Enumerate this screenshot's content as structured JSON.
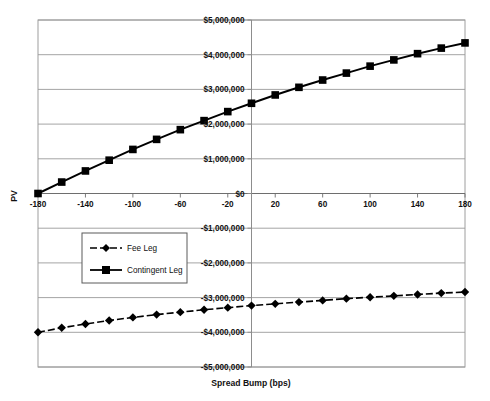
{
  "chart_data": {
    "type": "line",
    "title": "",
    "xlabel": "Spread Bump (bps)",
    "ylabel": "PV",
    "xlim": [
      -180,
      180
    ],
    "ylim": [
      -5000000,
      5000000
    ],
    "grid": true,
    "legend_position": "center-left",
    "x_ticks": [
      -180,
      -140,
      -100,
      -60,
      -20,
      20,
      60,
      100,
      140,
      180
    ],
    "x_tick_labels": [
      "-180",
      "-140",
      "-100",
      "-60",
      "-20",
      "20",
      "60",
      "100",
      "140",
      "180"
    ],
    "y_ticks": [
      5000000,
      4000000,
      3000000,
      2000000,
      1000000,
      0,
      -1000000,
      -2000000,
      -3000000,
      -4000000,
      -5000000
    ],
    "y_tick_labels": [
      "$5,000,000",
      "$4,000,000",
      "$3,000,000",
      "$2,000,000",
      "$1,000,000",
      "$0",
      "-$1,000,000",
      "-$2,000,000",
      "-$3,000,000",
      "-$4,000,000",
      "-$5,000,000"
    ],
    "x": [
      -180,
      -160,
      -140,
      -120,
      -100,
      -80,
      -60,
      -40,
      -20,
      0,
      20,
      40,
      60,
      80,
      100,
      120,
      140,
      160,
      180
    ],
    "series": [
      {
        "name": "Fee Leg",
        "marker": "diamond",
        "linestyle": "dashed",
        "color": "#000000",
        "values": [
          -4000000,
          -3870000,
          -3760000,
          -3660000,
          -3570000,
          -3490000,
          -3420000,
          -3350000,
          -3290000,
          -3230000,
          -3180000,
          -3130000,
          -3080000,
          -3030000,
          -2990000,
          -2950000,
          -2910000,
          -2870000,
          -2840000
        ]
      },
      {
        "name": "Contingent Leg",
        "marker": "square",
        "linestyle": "solid",
        "color": "#000000",
        "values": [
          0,
          330000,
          650000,
          960000,
          1270000,
          1560000,
          1840000,
          2100000,
          2360000,
          2600000,
          2840000,
          3060000,
          3270000,
          3470000,
          3670000,
          3850000,
          4030000,
          4190000,
          4340000
        ]
      }
    ]
  },
  "legend": {
    "entries": [
      {
        "label": "Fee Leg"
      },
      {
        "label": "Contingent Leg"
      }
    ]
  },
  "axes": {
    "x_title": "Spread Bump (bps)",
    "y_title": "PV"
  },
  "colors": {
    "plot_background": "#ffffff",
    "gridline": "#9a9a9a",
    "axis": "#8d8d8d",
    "series": "#000000",
    "text": "#111111"
  }
}
